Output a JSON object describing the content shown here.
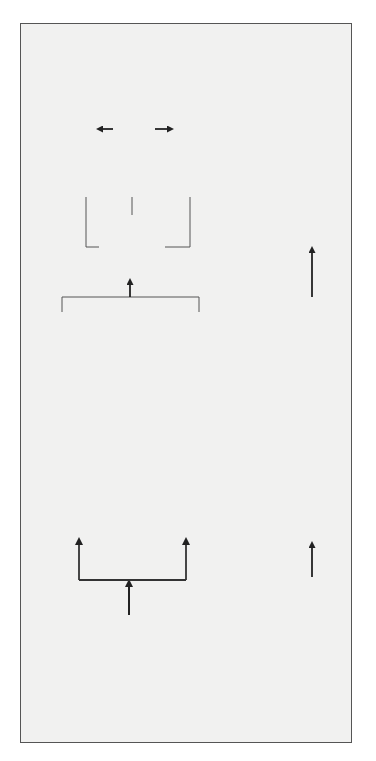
{
  "diagram": {
    "orientation": "rotated-90-ccw",
    "colors": {
      "frame_background": "#f1f1f0",
      "frame_border": "#555555",
      "process_box_fill": "#f6f6f5",
      "assessment_box_fill": "#cdcdcd",
      "line": "#333333",
      "dashed_link": "#999999"
    },
    "planning_track": {
      "foundation": {
        "line1": "FOUNDATION",
        "line2": "STUDIES"
      },
      "scenarios": [
        {
          "label": "SCENARIO A",
          "steps": [
            {
              "icon": "overlapping-circles-icon",
              "line1": "INITIAL",
              "line2": "OPTIONS"
            },
            {
              "icon": "overlapping-squares-icon",
              "line1": "HYBRID",
              "line2": "OPTIONS"
            },
            {
              "icon": "stacked-triangles-icon",
              "line1": "PREFERRED",
              "line2": "OPTIONS"
            }
          ]
        },
        {
          "label": "SCENARIO B",
          "steps": [
            {
              "icon": "overlapping-circles-icon",
              "line1": "INITIAL",
              "line2": "OPTIONS"
            },
            {
              "icon": "overlapping-squares-icon",
              "line1": "HYBRID",
              "line2": "OPTIONS"
            },
            {
              "icon": "stacked-triangles-icon",
              "line1": "PREFERRED",
              "line2": "OPTIONS"
            }
          ]
        }
      ],
      "strategy": {
        "line1": "LONG",
        "line2": "TERM",
        "line3": "RECOMMENDED",
        "line4": "STRATEGY"
      },
      "outputs": {
        "sectoral": {
          "line1": "SECTORAL LAND USE",
          "line2": "STRATEGIES"
        },
        "medium_term": {
          "line1": "MEDIUM TERM TERRITORIAL",
          "line2": "DEVELOPMENT PLAN &",
          "line3": "PROGRAMME"
        },
        "spatial": {
          "line1": "SPATIAL DEVELOPMENT",
          "line2": "PLAN & PROGRAMMES"
        }
      }
    },
    "environmental_track": {
      "baseline": {
        "line1": "Environmental",
        "line2": "Baseline Study"
      },
      "assessment": {
        "line1": "Strategic Environmental",
        "line2": "Assessment of Hybrid or",
        "line3": "Preferred Options"
      },
      "follow_up": {
        "line1": "Environmental",
        "line2": "Follow-up Plan"
      }
    }
  }
}
